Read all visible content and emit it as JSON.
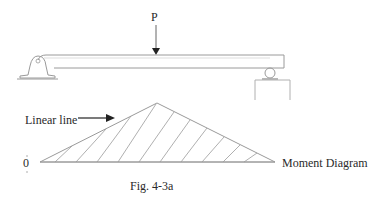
{
  "figure": {
    "caption": "Fig. 4-3a",
    "load_label": "P",
    "annotation_label": "Linear line",
    "diagram_label": "Moment Diagram",
    "zero_label": "0"
  },
  "colors": {
    "line": "#9a9a9a",
    "dark_line": "#222222",
    "text": "#2a2a2a"
  }
}
